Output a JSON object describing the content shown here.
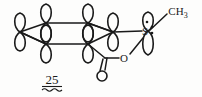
{
  "figure": {
    "kind": "chemical-structure-diagram",
    "compound_label": "25",
    "background_color": "#fdfdfc",
    "ink_color": "#1a1a1a"
  },
  "atoms": {
    "sulfur": "S",
    "ester_oxygen": "O",
    "carbonyl_oxygen": "O",
    "methyl": "CH",
    "methyl_subscript": "3"
  },
  "orbitals": {
    "count": 6,
    "type": "p-orbital-lobe-pair",
    "description": "figure-eight p orbitals on each benzene ring carbon"
  },
  "lone_pairs": {
    "sulfur_top_pair": "::",
    "sulfur_right_pair": "::"
  },
  "bonds": {
    "ring": "benzene-ring-perspective",
    "carbonyl": "C=O double bond",
    "ester": "C-O-S single bonds",
    "s_methyl": "S-CH3 single bond"
  }
}
